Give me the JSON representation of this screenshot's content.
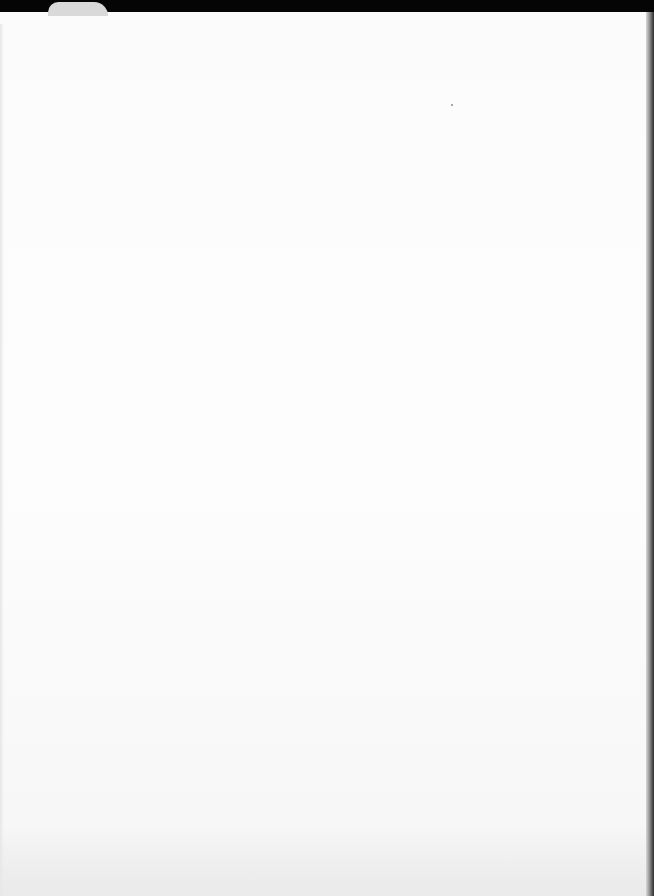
{
  "document": {
    "type": "scanned-page",
    "content": "",
    "colors": {
      "paper": "#fbfbfb",
      "border": "#000000"
    }
  }
}
